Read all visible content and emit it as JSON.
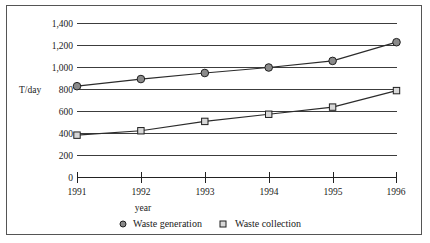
{
  "chart_data": {
    "type": "line",
    "title": "",
    "xlabel": "year",
    "ylabel": "T/day",
    "x": [
      "1991",
      "1992",
      "1993",
      "1994",
      "1995",
      "1996"
    ],
    "categories": [
      "1991",
      "1992",
      "1993",
      "1994",
      "1995",
      "1996"
    ],
    "series": [
      {
        "name": "Waste generation",
        "marker": "circle",
        "values": [
          830,
          895,
          950,
          1000,
          1060,
          1230
        ]
      },
      {
        "name": "Waste collection",
        "marker": "square",
        "values": [
          385,
          425,
          510,
          575,
          640,
          790
        ]
      }
    ],
    "ylim": [
      0,
      1400
    ],
    "ytick_labels": [
      "0",
      "200",
      "400",
      "600",
      "800",
      "1,000",
      "1,200",
      "1,400"
    ],
    "ytick_values": [
      0,
      200,
      400,
      600,
      800,
      1000,
      1200,
      1400
    ],
    "grid": true,
    "legend_position": "bottom",
    "colors": {
      "generation_marker": "#8a8a8a",
      "collection_marker": "#d8d8d8",
      "line": "#2b2b2b",
      "gridline": "#3c3c3c",
      "border": "#555555",
      "background": "#ffffff"
    }
  },
  "legend": {
    "items": [
      {
        "label": "Waste generation",
        "marker": "circle-marker-icon"
      },
      {
        "label": "Waste collection",
        "marker": "square-marker-icon"
      }
    ]
  },
  "axes": {
    "y_axis_title": "T/day",
    "x_axis_title": "year"
  }
}
